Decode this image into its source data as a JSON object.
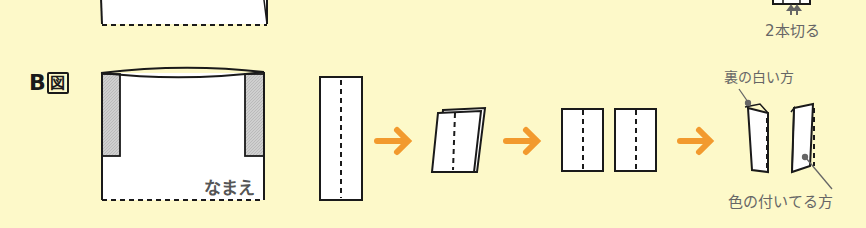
{
  "figure": {
    "label_letter": "B",
    "label_kanji": "図",
    "name_text": "なまえ",
    "cut_text": "2本切る",
    "white_back_label": "裏の白い方",
    "colored_side_label": "色の付いてる方"
  },
  "colors": {
    "background": "#fdf9c9",
    "arrow": "#f29a2e",
    "stroke": "#1a1a1a",
    "shade": "#c8c8c8",
    "caption": "#666666"
  },
  "steps": [
    {
      "id": "bag-b",
      "description": "Bag with shaded side strips and name area"
    },
    {
      "id": "long-strip",
      "description": "Long strip with dashed center line"
    },
    {
      "id": "folded",
      "description": "Strip folded in half"
    },
    {
      "id": "two-pieces",
      "description": "Two pieces after cutting"
    },
    {
      "id": "folded-pieces",
      "description": "Each piece folded along dashed line"
    }
  ]
}
